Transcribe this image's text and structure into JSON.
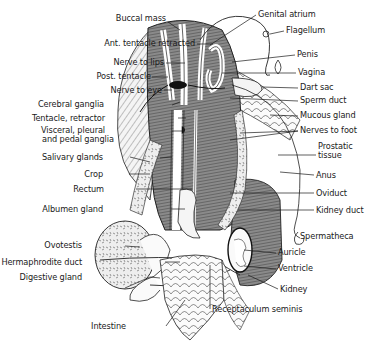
{
  "figure": {
    "colors": {
      "ink": "#1a1a1a",
      "background": "#ffffff",
      "tissue_dark": "#6e6e6e",
      "tissue_mid": "#9a9a9a"
    }
  },
  "labels_left": [
    {
      "text": "Buccal mass",
      "x": 120,
      "y": 18
    },
    {
      "text": "Ant. tentacle retracted",
      "x": 120,
      "y": 41
    },
    {
      "text": "Nerve to lips",
      "x": 116,
      "y": 60
    },
    {
      "text": "Post. tentacle",
      "x": 106,
      "y": 73
    },
    {
      "text": "Nerve to eye",
      "x": 114,
      "y": 87
    },
    {
      "text": "Cerebral ganglia",
      "x": 105,
      "y": 102
    },
    {
      "text": "Tentacle, retractor",
      "x": 104,
      "y": 115
    },
    {
      "text": "Visceral, pleural",
      "x": 104,
      "y": 127
    },
    {
      "text": "and pedal ganglia",
      "x": 104,
      "y": 136
    },
    {
      "text": "Salivary glands",
      "x": 103,
      "y": 154
    },
    {
      "text": "Crop",
      "x": 103,
      "y": 171
    },
    {
      "text": "Rectum",
      "x": 103,
      "y": 186
    },
    {
      "text": "Albumen gland",
      "x": 103,
      "y": 206
    },
    {
      "text": "Ovotestis",
      "x": 82,
      "y": 243
    },
    {
      "text": "Hermaphrodite duct",
      "x": 82,
      "y": 259
    },
    {
      "text": "Digestive gland",
      "x": 82,
      "y": 274
    },
    {
      "text": "Intestine",
      "x": 126,
      "y": 324
    }
  ],
  "labels_right": [
    {
      "text": "Genital atrium",
      "x": 258,
      "y": 12
    },
    {
      "text": "Flagellum",
      "x": 286,
      "y": 28
    },
    {
      "text": "Penis",
      "x": 297,
      "y": 52
    },
    {
      "text": "Vagina",
      "x": 298,
      "y": 70
    },
    {
      "text": "Dart sac",
      "x": 300,
      "y": 85
    },
    {
      "text": "Sperm duct",
      "x": 300,
      "y": 98
    },
    {
      "text": "Mucous gland",
      "x": 300,
      "y": 113
    },
    {
      "text": "Nerves to foot",
      "x": 300,
      "y": 128
    },
    {
      "text": "Prostatic",
      "x": 318,
      "y": 144
    },
    {
      "text": "tissue",
      "x": 318,
      "y": 154
    },
    {
      "text": "Anus",
      "x": 316,
      "y": 172
    },
    {
      "text": "Oviduct",
      "x": 316,
      "y": 190
    },
    {
      "text": "Kidney duct",
      "x": 316,
      "y": 207
    },
    {
      "text": "Spermatheca",
      "x": 300,
      "y": 234
    },
    {
      "text": "Auricle",
      "x": 278,
      "y": 250
    },
    {
      "text": "Ventricle",
      "x": 278,
      "y": 266
    },
    {
      "text": "Kidney",
      "x": 280,
      "y": 286
    },
    {
      "text": "Receptaculum seminis",
      "x": 212,
      "y": 306
    }
  ]
}
